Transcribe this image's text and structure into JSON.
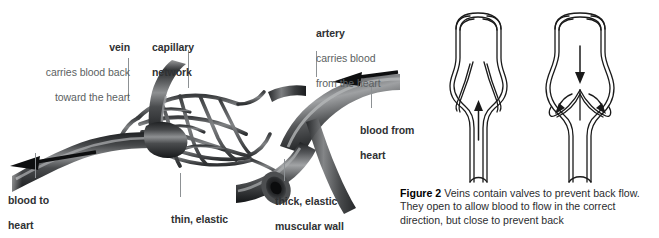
{
  "figure": {
    "caption_label": "Figure 2",
    "caption_text": " Veins contain valves to prevent back flow. They open to allow blood to flow in the correct direction, but close to prevent back"
  },
  "labels": {
    "vein": {
      "heading": "vein",
      "line1": "carries blood back",
      "line2": "toward the heart"
    },
    "capillary": {
      "line1": "capillary",
      "line2": "network"
    },
    "artery": {
      "heading": "artery",
      "line1": "carries blood",
      "line2": "from the heart"
    },
    "blood_from_heart": {
      "line1": "blood from",
      "line2": "heart"
    },
    "blood_to_heart": {
      "line1": "blood to",
      "line2": "heart"
    },
    "thin_wall": {
      "line1": "thin, elastic",
      "line2": "muscular wall"
    },
    "thick_wall": {
      "line1": "thick, elastic",
      "line2": "muscular wall"
    }
  },
  "valve_diagrams": [
    {
      "name": "valve-open",
      "state": "open",
      "flow_direction": "up"
    },
    {
      "name": "valve-closed",
      "state": "closed",
      "flow_direction": "down"
    }
  ],
  "colors": {
    "vessel_dark": "#2d2f31",
    "vessel_mid": "#58595b",
    "vessel_light": "#9b9d9f",
    "label_heading": "#2f3133",
    "label_body": "#5b5f62",
    "leader_line": "#8d9194",
    "outline": "#1a1a1a",
    "background": "#ffffff"
  }
}
